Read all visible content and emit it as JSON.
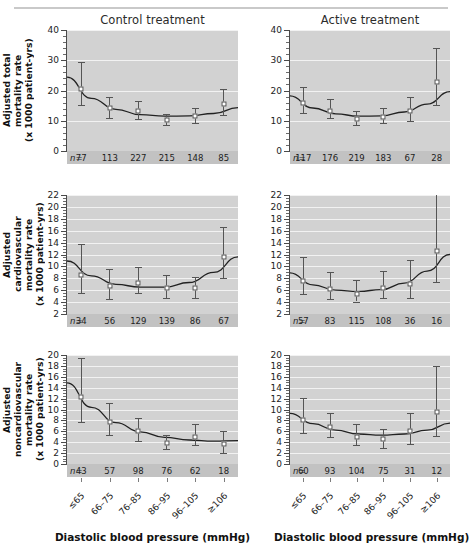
{
  "figure": {
    "column_titles": [
      "Control treatment",
      "Active treatment"
    ],
    "x_axis_title": "Diastolic blood pressure (mmHg)",
    "n_prefix": "n=",
    "categories": [
      "≤65",
      "66–75",
      "76–85",
      "86–95",
      "96–105",
      "≥106"
    ],
    "colors": {
      "plot_background": "#d2d2d2",
      "gridline": "#f2f2f2",
      "n_band": "#c2c2c2",
      "curve": "#222222",
      "error_bar": "#555555",
      "marker_fill": "#ffffff",
      "marker_edge": "#4c4c4c",
      "axis": "#4a4a4a",
      "top_rule": "#c9c9c9"
    }
  },
  "chart_data": [
    {
      "type": "scatter",
      "title": "Control treatment",
      "row": "Adjusted total mortality rate",
      "ylabel": "Adjusted total mortality rate\n(x 1000 patient-yrs)",
      "xlabel": "Diastolic blood pressure (mmHg)",
      "ylim": [
        0,
        40
      ],
      "yticks": [
        0,
        10,
        20,
        30,
        40
      ],
      "yminor_step": 2,
      "grid": true,
      "categories": [
        "≤65",
        "66–75",
        "76–85",
        "86–95",
        "96–105",
        "≥106"
      ],
      "values": [
        20.4,
        14.3,
        13.3,
        10.2,
        11.6,
        15.5
      ],
      "ci_low": [
        15.1,
        10.8,
        10.6,
        8.6,
        9.3,
        11.8
      ],
      "ci_high": [
        29.3,
        17.7,
        16.6,
        12.1,
        14.1,
        20.4
      ],
      "n": [
        77,
        113,
        227,
        215,
        148,
        85
      ],
      "fitted_curve": [
        24.4,
        17.4,
        13.8,
        12.0,
        11.5,
        11.6,
        12.4,
        14.3
      ]
    },
    {
      "type": "scatter",
      "title": "Active treatment",
      "row": "Adjusted total mortality rate",
      "ylabel": "Adjusted total mortality rate\n(x 1000 patient-yrs)",
      "xlabel": "Diastolic blood pressure (mmHg)",
      "ylim": [
        0,
        40
      ],
      "yticks": [
        0,
        10,
        20,
        30,
        40
      ],
      "yminor_step": 2,
      "grid": true,
      "categories": [
        "≤65",
        "66–75",
        "76–85",
        "86–95",
        "96–105",
        "≥106"
      ],
      "values": [
        15.9,
        13.2,
        10.7,
        11.4,
        13.1,
        22.7
      ],
      "ci_low": [
        12.4,
        10.8,
        8.7,
        9.2,
        9.8,
        15.2
      ],
      "ci_high": [
        21.2,
        17.1,
        13.1,
        14.2,
        17.9,
        34.2
      ],
      "n": [
        117,
        176,
        219,
        183,
        67,
        28
      ],
      "fitted_curve": [
        18.2,
        14.2,
        12.3,
        11.5,
        11.6,
        12.9,
        15.5,
        19.6
      ]
    },
    {
      "type": "scatter",
      "title": "Control treatment",
      "row": "Adjusted cardiovascular mortality rate",
      "ylabel": "Adjusted cardiovascular\nmortality rate\n(x 1000 patient-yrs)",
      "xlabel": "Diastolic blood pressure (mmHg)",
      "ylim": [
        2,
        22
      ],
      "yticks": [
        2,
        4,
        6,
        8,
        10,
        12,
        14,
        16,
        18,
        20,
        22
      ],
      "yminor_step": 0.5,
      "grid": true,
      "categories": [
        "≤65",
        "66–75",
        "76–85",
        "86–95",
        "96–105",
        "≥106"
      ],
      "values": [
        8.6,
        6.7,
        7.2,
        6.4,
        6.3,
        11.5
      ],
      "ci_low": [
        5.6,
        4.6,
        5.6,
        4.7,
        4.7,
        8.1
      ],
      "ci_high": [
        13.8,
        9.5,
        9.9,
        8.5,
        8.3,
        16.6
      ],
      "n": [
        34,
        56,
        129,
        139,
        86,
        67
      ],
      "fitted_curve": [
        10.9,
        8.4,
        7.0,
        6.5,
        6.5,
        7.3,
        9.0,
        11.6
      ]
    },
    {
      "type": "scatter",
      "title": "Active treatment",
      "row": "Adjusted cardiovascular mortality rate",
      "ylabel": "Adjusted cardiovascular\nmortality rate\n(x 1000 patient-yrs)",
      "xlabel": "Diastolic blood pressure (mmHg)",
      "ylim": [
        2,
        22
      ],
      "yticks": [
        2,
        4,
        6,
        8,
        10,
        12,
        14,
        16,
        18,
        20,
        22
      ],
      "yminor_step": 0.5,
      "grid": true,
      "categories": [
        "≤65",
        "66–75",
        "76–85",
        "86–95",
        "96–105",
        "≥106"
      ],
      "values": [
        7.6,
        6.2,
        5.4,
        6.4,
        7.1,
        12.6
      ],
      "ci_low": [
        5.3,
        4.5,
        4.1,
        4.7,
        4.7,
        7.3
      ],
      "ci_high": [
        11.5,
        9.0,
        7.7,
        9.3,
        11.0,
        22.2
      ],
      "n": [
        57,
        83,
        115,
        108,
        36,
        16
      ],
      "fitted_curve": [
        8.9,
        6.9,
        6.0,
        5.8,
        6.1,
        7.2,
        9.2,
        12.0
      ]
    },
    {
      "type": "scatter",
      "title": "Control treatment",
      "row": "Adjusted noncardiovascular mortality rate",
      "ylabel": "Adjusted noncardiovascular\nmortality rate\n(x 1000 patient-yrs)",
      "xlabel": "Diastolic blood pressure (mmHg)",
      "ylim": [
        0,
        20
      ],
      "yticks": [
        0,
        2,
        4,
        6,
        8,
        10,
        12,
        14,
        16,
        18,
        20
      ],
      "yminor_step": 0.5,
      "grid": true,
      "categories": [
        "≤65",
        "66–75",
        "76–85",
        "86–95",
        "96–105",
        "≥106"
      ],
      "values": [
        12.3,
        7.7,
        6.1,
        3.8,
        5.0,
        3.7
      ],
      "ci_low": [
        7.7,
        5.3,
        4.2,
        2.7,
        3.5,
        2.1
      ],
      "ci_high": [
        19.4,
        11.2,
        8.5,
        5.3,
        7.3,
        6.0
      ],
      "n": [
        43,
        57,
        98,
        76,
        62,
        18
      ],
      "fitted_curve": [
        14.9,
        10.4,
        7.6,
        5.9,
        4.9,
        4.4,
        4.2,
        4.3
      ]
    },
    {
      "type": "scatter",
      "title": "Active treatment",
      "row": "Adjusted noncardiovascular mortality rate",
      "ylabel": "Adjusted noncardiovascular\nmortality rate\n(x 1000 patient-yrs)",
      "xlabel": "Diastolic blood pressure (mmHg)",
      "ylim": [
        0,
        20
      ],
      "yticks": [
        0,
        2,
        4,
        6,
        8,
        10,
        12,
        14,
        16,
        18,
        20
      ],
      "yminor_step": 0.5,
      "grid": true,
      "categories": [
        "≤65",
        "66–75",
        "76–85",
        "86–95",
        "96–105",
        "≥106"
      ],
      "values": [
        8.1,
        6.8,
        4.9,
        4.5,
        6.0,
        9.6
      ],
      "ci_low": [
        5.6,
        4.9,
        3.4,
        3.0,
        3.7,
        5.2
      ],
      "ci_high": [
        12.1,
        9.4,
        7.3,
        6.4,
        9.4,
        17.9
      ],
      "n": [
        60,
        93,
        104,
        75,
        31,
        12
      ],
      "fitted_curve": [
        9.3,
        7.4,
        6.2,
        5.5,
        5.3,
        5.5,
        6.2,
        7.5
      ]
    }
  ]
}
